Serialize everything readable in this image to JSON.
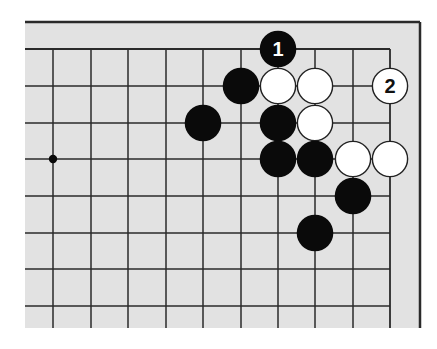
{
  "diagram": {
    "type": "go-board-corner",
    "colors": {
      "background": "#ffffff",
      "board": "#e2e2e2",
      "line": "#2a2a2a",
      "black_stone": "#0a0a0a",
      "white_stone": "#ffffff",
      "white_stone_edge": "#222222"
    },
    "grid": {
      "columns_x": [
        53,
        91,
        128,
        166,
        203,
        241,
        278,
        315,
        353,
        390
      ],
      "rows_y": [
        49,
        86,
        123,
        159,
        196,
        233,
        269,
        306
      ],
      "board_left": 25,
      "board_top": 22,
      "board_right": 420,
      "board_bottom": 328
    },
    "star_points": [
      {
        "col": 0,
        "row": 3
      }
    ],
    "stones": [
      {
        "color": "black",
        "col": 6,
        "row": 0,
        "label": "1"
      },
      {
        "color": "black",
        "col": 5,
        "row": 1,
        "label": ""
      },
      {
        "color": "white",
        "col": 6,
        "row": 1,
        "label": ""
      },
      {
        "color": "white",
        "col": 7,
        "row": 1,
        "label": ""
      },
      {
        "color": "white",
        "col": 9,
        "row": 1,
        "label": "2"
      },
      {
        "color": "black",
        "col": 4,
        "row": 2,
        "label": ""
      },
      {
        "color": "black",
        "col": 6,
        "row": 2,
        "label": ""
      },
      {
        "color": "white",
        "col": 7,
        "row": 2,
        "label": ""
      },
      {
        "color": "black",
        "col": 6,
        "row": 3,
        "label": ""
      },
      {
        "color": "black",
        "col": 7,
        "row": 3,
        "label": ""
      },
      {
        "color": "white",
        "col": 8,
        "row": 3,
        "label": ""
      },
      {
        "color": "white",
        "col": 9,
        "row": 3,
        "label": ""
      },
      {
        "color": "black",
        "col": 8,
        "row": 4,
        "label": ""
      },
      {
        "color": "black",
        "col": 7,
        "row": 5,
        "label": ""
      }
    ],
    "move_labels": [
      "1",
      "2"
    ]
  }
}
